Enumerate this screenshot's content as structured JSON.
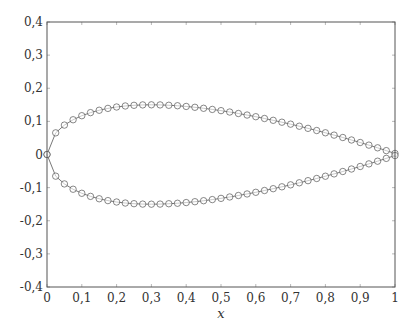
{
  "chart_data": {
    "type": "line",
    "title": "",
    "xlabel": "x",
    "ylabel": "",
    "xlim": [
      0,
      1
    ],
    "ylim": [
      -0.4,
      0.4
    ],
    "grid": false,
    "legend": null,
    "x_ticks": [
      "0",
      "0,1",
      "0,2",
      "0,3",
      "0,4",
      "0,5",
      "0,6",
      "0,7",
      "0,8",
      "0,9",
      "1"
    ],
    "y_ticks": [
      "-0,4",
      "-0,3",
      "-0,2",
      "-0,1",
      "0",
      "0,1",
      "0,2",
      "0,3",
      "0,4"
    ],
    "marker": "circle-open",
    "line_color": "#555555",
    "series": [
      {
        "name": "upper",
        "x": [
          0,
          0.025,
          0.05,
          0.075,
          0.1,
          0.125,
          0.15,
          0.175,
          0.2,
          0.225,
          0.25,
          0.275,
          0.3,
          0.325,
          0.35,
          0.375,
          0.4,
          0.425,
          0.45,
          0.475,
          0.5,
          0.525,
          0.55,
          0.575,
          0.6,
          0.625,
          0.65,
          0.675,
          0.7,
          0.725,
          0.75,
          0.775,
          0.8,
          0.825,
          0.85,
          0.875,
          0.9,
          0.925,
          0.95,
          0.975,
          1.0
        ],
        "y": [
          0,
          0.0654,
          0.0888,
          0.1049,
          0.1171,
          0.1264,
          0.1336,
          0.1392,
          0.1434,
          0.1465,
          0.1485,
          0.1497,
          0.15,
          0.1497,
          0.1486,
          0.1472,
          0.1451,
          0.1425,
          0.1395,
          0.1361,
          0.1324,
          0.1282,
          0.1238,
          0.1191,
          0.1141,
          0.1087,
          0.1032,
          0.0975,
          0.0916,
          0.0854,
          0.079,
          0.0724,
          0.0656,
          0.0585,
          0.0513,
          0.0438,
          0.0362,
          0.0283,
          0.0202,
          0.0117,
          0.0032
        ]
      },
      {
        "name": "lower",
        "x": [
          0,
          0.025,
          0.05,
          0.075,
          0.1,
          0.125,
          0.15,
          0.175,
          0.2,
          0.225,
          0.25,
          0.275,
          0.3,
          0.325,
          0.35,
          0.375,
          0.4,
          0.425,
          0.45,
          0.475,
          0.5,
          0.525,
          0.55,
          0.575,
          0.6,
          0.625,
          0.65,
          0.675,
          0.7,
          0.725,
          0.75,
          0.775,
          0.8,
          0.825,
          0.85,
          0.875,
          0.9,
          0.925,
          0.95,
          0.975,
          1.0
        ],
        "y": [
          0,
          -0.0654,
          -0.0888,
          -0.1049,
          -0.1171,
          -0.1264,
          -0.1336,
          -0.1392,
          -0.1434,
          -0.1465,
          -0.1485,
          -0.1497,
          -0.15,
          -0.1497,
          -0.1486,
          -0.1472,
          -0.1451,
          -0.1425,
          -0.1395,
          -0.1361,
          -0.1324,
          -0.1282,
          -0.1238,
          -0.1191,
          -0.1141,
          -0.1087,
          -0.1032,
          -0.0975,
          -0.0916,
          -0.0854,
          -0.079,
          -0.0724,
          -0.0656,
          -0.0585,
          -0.0513,
          -0.0438,
          -0.0362,
          -0.0283,
          -0.0202,
          -0.0117,
          -0.0032
        ]
      }
    ]
  }
}
